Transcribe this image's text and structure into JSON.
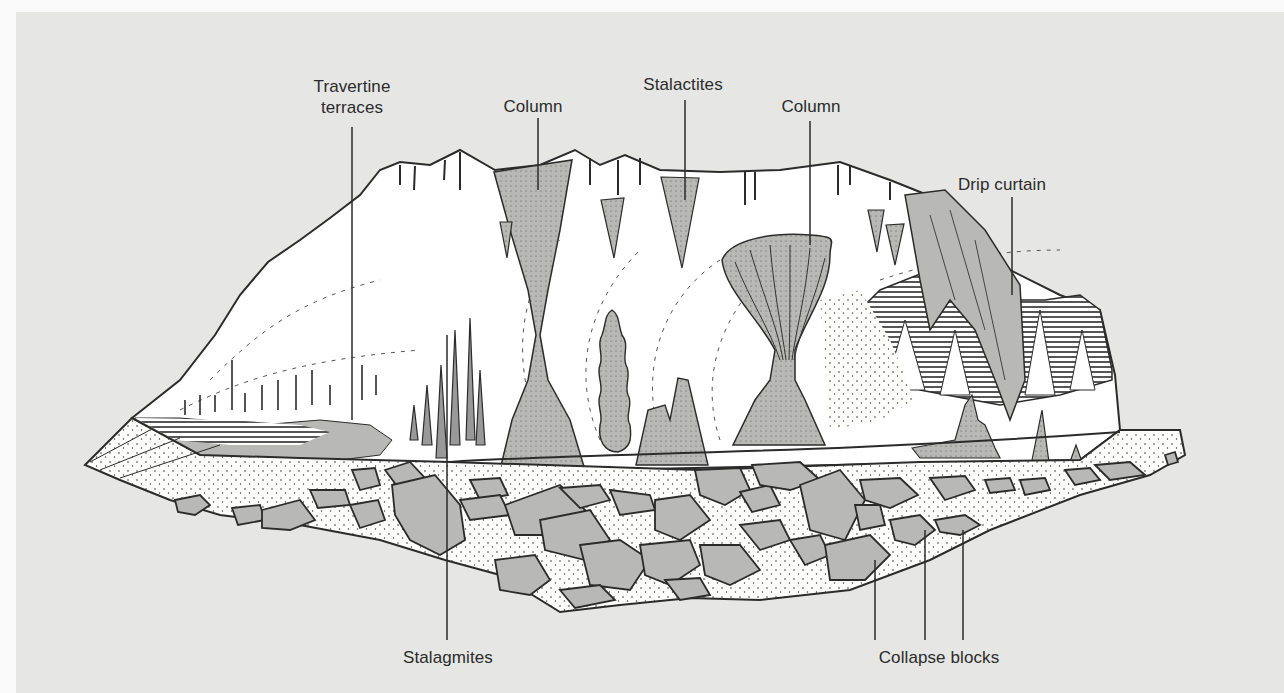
{
  "figure": {
    "type": "cave cross-section illustration",
    "background_color": "#e6e6e4",
    "rock_fill_color": "#b9b9b7",
    "line_color": "#2b2b2b"
  },
  "labels": {
    "travertine_line1": "Travertine",
    "travertine_line2": "terraces",
    "column_left": "Column",
    "stalactites": "Stalactites",
    "column_right": "Column",
    "drip_curtain": "Drip curtain",
    "stalagmites": "Stalagmites",
    "collapse_blocks": "Collapse blocks"
  },
  "features": [
    {
      "name": "Travertine terraces",
      "label_pos": [
        352,
        88
      ],
      "points_to": [
        352,
        420
      ]
    },
    {
      "name": "Column",
      "label_pos": [
        533,
        105
      ],
      "points_to": [
        538,
        190
      ]
    },
    {
      "name": "Stalactites",
      "label_pos": [
        683,
        82
      ],
      "points_to": [
        685,
        200
      ]
    },
    {
      "name": "Column",
      "label_pos": [
        811,
        105
      ],
      "points_to": [
        810,
        245
      ]
    },
    {
      "name": "Drip curtain",
      "label_pos": [
        992,
        183
      ],
      "points_to": [
        1012,
        295
      ]
    },
    {
      "name": "Stalagmites",
      "label_pos": [
        448,
        656
      ],
      "points_to": [
        447,
        335
      ]
    },
    {
      "name": "Collapse blocks",
      "label_pos": [
        934,
        656
      ],
      "points_to": [
        [
          875,
          560
        ],
        [
          925,
          530
        ],
        [
          963,
          530
        ]
      ]
    }
  ]
}
